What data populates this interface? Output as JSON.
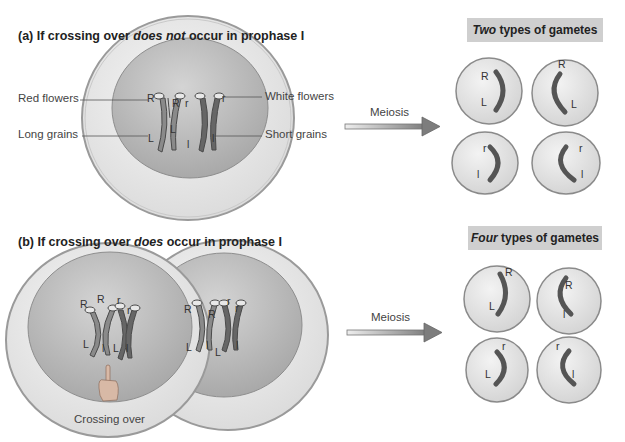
{
  "panel_a": {
    "title_prefix": "(a) If crossing over ",
    "title_emph": "does not",
    "title_suffix": " occur in prophase I",
    "labels": {
      "red_flowers": "Red flowers",
      "long_grains": "Long grains",
      "white_flowers": "White flowers",
      "short_grains": "Short grains"
    },
    "arrow_label": "Meiosis",
    "result": {
      "emph": "Two",
      "text": " types of gametes",
      "gametes": [
        {
          "top": "R",
          "bottom": "L"
        },
        {
          "top": "R",
          "bottom": "L"
        },
        {
          "top": "r",
          "bottom": "l"
        },
        {
          "top": "r",
          "bottom": "l"
        }
      ]
    },
    "chromosome_alleles": [
      "R",
      "R",
      "r",
      "r",
      "L",
      "L",
      "l",
      "l"
    ]
  },
  "panel_b": {
    "title_prefix": "(b) If crossing over ",
    "title_emph": "does",
    "title_suffix": " occur in prophase I",
    "arrow_label": "Meiosis",
    "crossing_over_label": "Crossing over",
    "result": {
      "emph": "Four",
      "text": " types of gametes",
      "gametes": [
        {
          "top": "R",
          "bottom": "L"
        },
        {
          "top": "R",
          "bottom": "l"
        },
        {
          "top": "r",
          "bottom": "L"
        },
        {
          "top": "r",
          "bottom": "l"
        }
      ]
    },
    "cell1_alleles": [
      "R",
      "R",
      "r",
      "r",
      "L",
      "l",
      "L",
      "l"
    ],
    "cell2_alleles": [
      "R",
      "R",
      "r",
      "r",
      "L",
      "l",
      "L",
      "l"
    ]
  },
  "colors": {
    "cell_outer": "#e6e6e6",
    "cell_border": "#9a9a9a",
    "nucleus": "#bdbdbd",
    "chromosome_dark": "#5a5a5a",
    "result_box_bg": "#cfcfcf",
    "arrow_fill": "#8a8a8a"
  }
}
